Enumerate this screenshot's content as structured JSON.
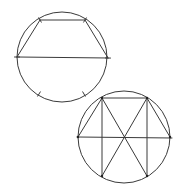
{
  "figure": {
    "stroke_color": "#3a3a3a",
    "background": "#ffffff"
  },
  "circle1": {
    "label": "trapezoid-inscribed-circle",
    "center": [
      62,
      57
    ],
    "radius": 45,
    "diameter": [
      [
        17,
        57
      ],
      [
        108,
        58
      ]
    ],
    "top_vertices": [
      [
        40,
        20
      ],
      [
        85,
        20
      ]
    ],
    "ticks": [
      [
        40,
        20
      ],
      [
        85,
        20
      ],
      [
        17,
        57
      ],
      [
        108,
        58
      ],
      [
        39,
        94
      ],
      [
        84,
        94
      ]
    ]
  },
  "circle2": {
    "label": "hexagon-construction-circle",
    "center": [
      124,
      137
    ],
    "radius": 46,
    "diameter": [
      [
        77,
        137
      ],
      [
        172,
        138
      ]
    ],
    "vertices": {
      "top_left": [
        102,
        98
      ],
      "top_right": [
        147,
        98
      ],
      "bottom_left": [
        102,
        176
      ],
      "bottom_right": [
        147,
        176
      ],
      "left": [
        78,
        137
      ],
      "right": [
        170,
        137
      ]
    }
  }
}
